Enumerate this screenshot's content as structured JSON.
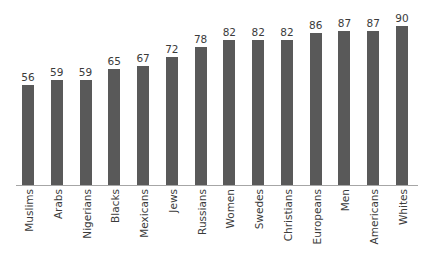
{
  "chart_data": {
    "type": "bar",
    "title": "",
    "subtitle": "",
    "xlabel": "",
    "ylabel": "",
    "ylim": [
      0,
      100
    ],
    "grid": false,
    "legend": "none",
    "orientation": "vertical",
    "bar_color": "#595959",
    "axis_color": "#a6a6a6",
    "text_color": "#3b3b3b",
    "background": "#ffffff",
    "value_labels_shown": true,
    "y_axis_shown": false,
    "x_tick_label_rotation": -90,
    "categories": [
      "Muslims",
      "Arabs",
      "Nigerians",
      "Blacks",
      "Mexicans",
      "Jews",
      "Russians",
      "Women",
      "Swedes",
      "Christians",
      "Europeans",
      "Men",
      "Americans",
      "Whites"
    ],
    "values": [
      56,
      59,
      59,
      65,
      67,
      72,
      78,
      82,
      82,
      82,
      86,
      87,
      87,
      90
    ],
    "value_label_texts": [
      "56",
      "59",
      "59",
      "65",
      "67",
      "72",
      "78",
      "82",
      "82",
      "82",
      "86",
      "87",
      "87",
      "90"
    ]
  }
}
